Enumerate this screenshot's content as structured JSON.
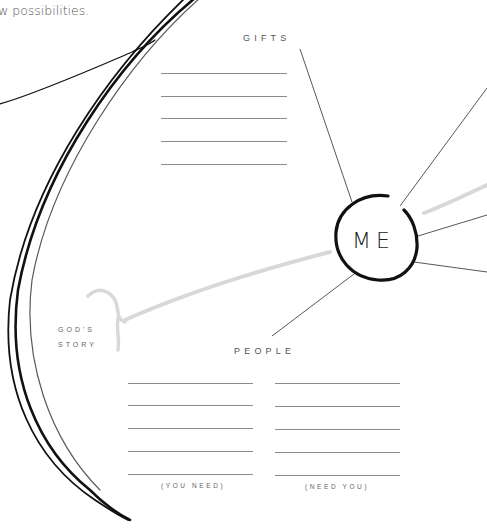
{
  "intro_text": "w possibilities.",
  "center": {
    "label": "ME"
  },
  "gifts": {
    "label": "GIFTS",
    "line_count": 5
  },
  "people": {
    "label": "PEOPLE",
    "columns": [
      {
        "caption": "(YOU NEED)",
        "line_count": 5
      },
      {
        "caption": "(NEED YOU)",
        "line_count": 5
      }
    ]
  },
  "gods_story": {
    "line1": "GOD'S",
    "line2": "STORY"
  },
  "colors": {
    "ink": "#111111",
    "rule": "#8a8a8a",
    "brush": "#d8d8d8",
    "text": "#555555"
  }
}
